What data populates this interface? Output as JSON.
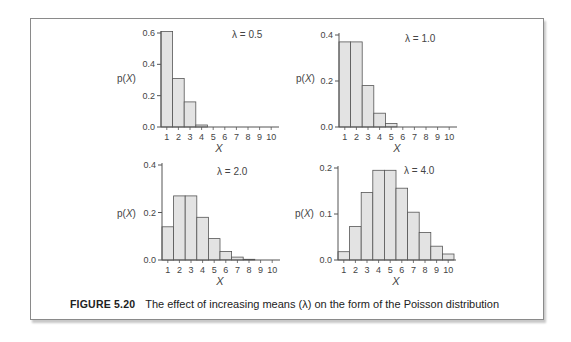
{
  "figure": {
    "number_label": "FIGURE 5.20",
    "caption": "The effect of increasing means (λ) on the form of the Poisson distribution"
  },
  "chart_data": [
    {
      "type": "bar",
      "title": "λ = 0.5",
      "xlabel": "X",
      "ylabel": "p(X)",
      "categories": [
        "1",
        "2",
        "3",
        "4",
        "5",
        "6",
        "7",
        "8",
        "9",
        "10"
      ],
      "values": [
        0.61,
        0.31,
        0.16,
        0.013,
        0,
        0,
        0,
        0,
        0,
        0
      ],
      "yticks": [
        "0.0",
        "0.2",
        "0.4",
        "0.6"
      ],
      "ylim": [
        0,
        0.6
      ],
      "grid": false
    },
    {
      "type": "bar",
      "title": "λ = 1.0",
      "xlabel": "X",
      "ylabel": "p(X)",
      "categories": [
        "1",
        "2",
        "3",
        "4",
        "5",
        "6",
        "7",
        "8",
        "9",
        "10"
      ],
      "values": [
        0.37,
        0.37,
        0.18,
        0.06,
        0.015,
        0,
        0,
        0,
        0,
        0
      ],
      "yticks": [
        "0.0",
        "0.2",
        "0.4"
      ],
      "ylim": [
        0,
        0.4
      ],
      "grid": false
    },
    {
      "type": "bar",
      "title": "λ = 2.0",
      "xlabel": "X",
      "ylabel": "p(X)",
      "categories": [
        "1",
        "2",
        "3",
        "4",
        "5",
        "6",
        "7",
        "8",
        "9",
        "10"
      ],
      "values": [
        0.14,
        0.27,
        0.27,
        0.18,
        0.09,
        0.036,
        0.012,
        0.003,
        0,
        0
      ],
      "yticks": [
        "0.0",
        "0.2",
        "0.4"
      ],
      "ylim": [
        0,
        0.4
      ],
      "grid": false
    },
    {
      "type": "bar",
      "title": "λ = 4.0",
      "xlabel": "X",
      "ylabel": "p(X)",
      "categories": [
        "1",
        "2",
        "3",
        "4",
        "5",
        "6",
        "7",
        "8",
        "9",
        "10"
      ],
      "values": [
        0.018,
        0.073,
        0.147,
        0.195,
        0.195,
        0.156,
        0.104,
        0.06,
        0.03,
        0.013
      ],
      "yticks": [
        "0.0",
        "0.1",
        "0.2"
      ],
      "ylim": [
        0,
        0.2
      ],
      "grid": false
    }
  ],
  "colors": {
    "bar_fill": "#e3e3e3",
    "bar_stroke": "#555555",
    "axis": "#555555",
    "text": "#444444"
  }
}
